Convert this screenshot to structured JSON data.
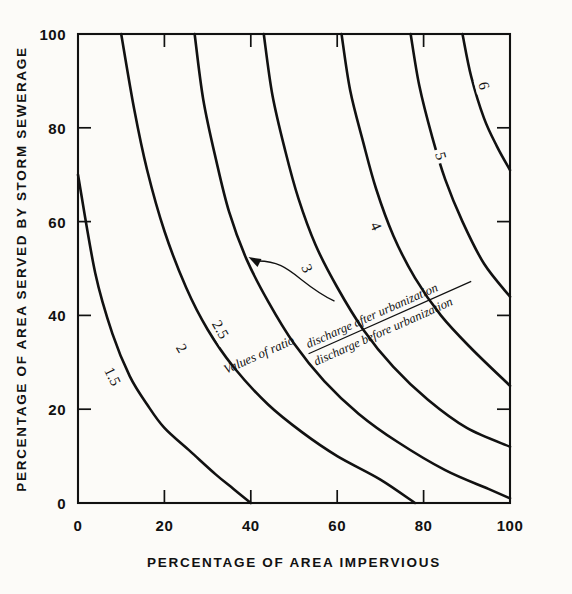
{
  "figure": {
    "title": "",
    "background_color": "#fcfbf8",
    "ink_color": "#111111"
  },
  "axes": {
    "x": {
      "label": "PERCENTAGE OF AREA IMPERVIOUS",
      "min": 0,
      "max": 100,
      "ticks": [
        0,
        20,
        40,
        60,
        80,
        100
      ],
      "tick_labels": [
        "0",
        "20",
        "40",
        "60",
        "80",
        "100"
      ]
    },
    "y": {
      "label": "PERCENTAGE OF AREA SERVED BY STORM SEWERAGE",
      "min": 0,
      "max": 100,
      "ticks": [
        0,
        20,
        40,
        60,
        80,
        100
      ],
      "tick_labels": [
        "0",
        "20",
        "40",
        "60",
        "80",
        "100"
      ]
    }
  },
  "annotation": {
    "lead_text": "Values of ratio",
    "numerator": "discharge after urbanization",
    "denominator": "discharge before urbanization",
    "points_to_contour": "2.5"
  },
  "chart_data": {
    "type": "line",
    "subtype": "contour",
    "title": "",
    "xlabel": "PERCENTAGE OF AREA IMPERVIOUS",
    "ylabel": "PERCENTAGE OF AREA SERVED BY STORM SEWERAGE",
    "xlim": [
      0,
      100
    ],
    "ylim": [
      0,
      100
    ],
    "grid": false,
    "legend": "inline-contour-labels",
    "annotations": [
      {
        "text": "Values of ratio discharge after urbanization / discharge before urbanization",
        "target_contour": "2.5",
        "arrow": true
      }
    ],
    "series": [
      {
        "name": "1.5",
        "label": "1.5",
        "label_at": {
          "x": 8,
          "y": 27
        },
        "points": [
          {
            "x": 0,
            "y": 70
          },
          {
            "x": 4,
            "y": 49
          },
          {
            "x": 8,
            "y": 36
          },
          {
            "x": 12,
            "y": 27
          },
          {
            "x": 16,
            "y": 21
          },
          {
            "x": 20,
            "y": 16
          },
          {
            "x": 26,
            "y": 11
          },
          {
            "x": 32,
            "y": 6
          },
          {
            "x": 36,
            "y": 3
          },
          {
            "x": 40,
            "y": 0
          }
        ]
      },
      {
        "name": "2",
        "label": "2",
        "label_at": {
          "x": 24,
          "y": 33
        },
        "points": [
          {
            "x": 10,
            "y": 100
          },
          {
            "x": 13,
            "y": 84
          },
          {
            "x": 16,
            "y": 71
          },
          {
            "x": 20,
            "y": 58
          },
          {
            "x": 25,
            "y": 46
          },
          {
            "x": 30,
            "y": 37
          },
          {
            "x": 36,
            "y": 29
          },
          {
            "x": 44,
            "y": 21
          },
          {
            "x": 52,
            "y": 15
          },
          {
            "x": 60,
            "y": 10
          },
          {
            "x": 70,
            "y": 5
          },
          {
            "x": 78,
            "y": 0
          }
        ]
      },
      {
        "name": "2.5",
        "label": "2.5",
        "label_at": {
          "x": 33,
          "y": 37
        },
        "points": [
          {
            "x": 27,
            "y": 100
          },
          {
            "x": 29,
            "y": 86
          },
          {
            "x": 32,
            "y": 73
          },
          {
            "x": 35,
            "y": 62
          },
          {
            "x": 39,
            "y": 52
          },
          {
            "x": 44,
            "y": 43
          },
          {
            "x": 50,
            "y": 34
          },
          {
            "x": 57,
            "y": 26
          },
          {
            "x": 65,
            "y": 19
          },
          {
            "x": 74,
            "y": 13
          },
          {
            "x": 85,
            "y": 7
          },
          {
            "x": 95,
            "y": 3
          },
          {
            "x": 100,
            "y": 1
          }
        ]
      },
      {
        "name": "3",
        "label": "3",
        "label_at": {
          "x": 53,
          "y": 50
        },
        "points": [
          {
            "x": 43,
            "y": 100
          },
          {
            "x": 45,
            "y": 87
          },
          {
            "x": 48,
            "y": 75
          },
          {
            "x": 51,
            "y": 65
          },
          {
            "x": 55,
            "y": 55
          },
          {
            "x": 60,
            "y": 46
          },
          {
            "x": 66,
            "y": 37
          },
          {
            "x": 73,
            "y": 29
          },
          {
            "x": 81,
            "y": 22
          },
          {
            "x": 90,
            "y": 16
          },
          {
            "x": 100,
            "y": 12
          }
        ]
      },
      {
        "name": "4",
        "label": "4",
        "label_at": {
          "x": 69,
          "y": 59
        },
        "points": [
          {
            "x": 61,
            "y": 100
          },
          {
            "x": 63,
            "y": 88
          },
          {
            "x": 66,
            "y": 77
          },
          {
            "x": 69,
            "y": 67
          },
          {
            "x": 73,
            "y": 57
          },
          {
            "x": 78,
            "y": 48
          },
          {
            "x": 84,
            "y": 40
          },
          {
            "x": 91,
            "y": 33
          },
          {
            "x": 100,
            "y": 25
          }
        ]
      },
      {
        "name": "5",
        "label": "5",
        "label_at": {
          "x": 84,
          "y": 74
        },
        "points": [
          {
            "x": 77,
            "y": 100
          },
          {
            "x": 79,
            "y": 89
          },
          {
            "x": 82,
            "y": 78
          },
          {
            "x": 85,
            "y": 69
          },
          {
            "x": 89,
            "y": 60
          },
          {
            "x": 94,
            "y": 51
          },
          {
            "x": 100,
            "y": 44
          }
        ]
      },
      {
        "name": "6",
        "label": "6",
        "label_at": {
          "x": 94,
          "y": 89
        },
        "points": [
          {
            "x": 89,
            "y": 100
          },
          {
            "x": 91,
            "y": 91
          },
          {
            "x": 94,
            "y": 82
          },
          {
            "x": 97,
            "y": 76
          },
          {
            "x": 100,
            "y": 71
          }
        ]
      }
    ]
  }
}
